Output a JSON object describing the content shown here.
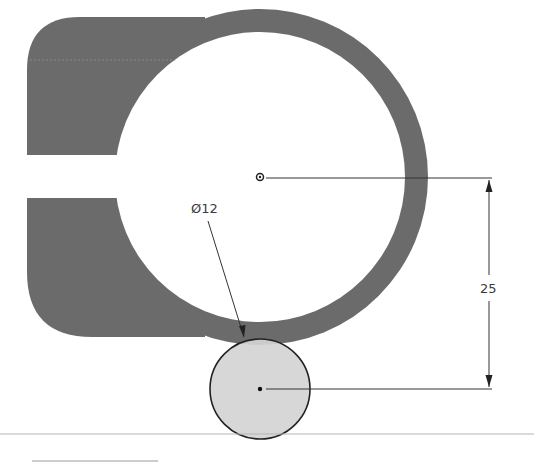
{
  "drawing": {
    "type": "2D sketch / technical drawing",
    "colors": {
      "background": "#ffffff",
      "part_fill": "#6b6b6b",
      "highlight_circle_fill": "#d4d4d4",
      "outline": "#222222",
      "dimension_line": "#333333",
      "divider_line": "#b5b5b5"
    },
    "part": {
      "description": "Clamp-style body: large ring with a left rectangular lug split by a slot",
      "ring_center": [
        260,
        177
      ],
      "ring_outer_radius": 168,
      "ring_inner_radius": 145
    },
    "small_circle": {
      "center": [
        260,
        389
      ],
      "radius": 50
    },
    "dimensions": {
      "diameter": {
        "label": "Ø12",
        "target": "small-circle"
      },
      "vertical_distance": {
        "label": "25",
        "from": "ring-center",
        "to": "small-circle-center"
      }
    }
  }
}
